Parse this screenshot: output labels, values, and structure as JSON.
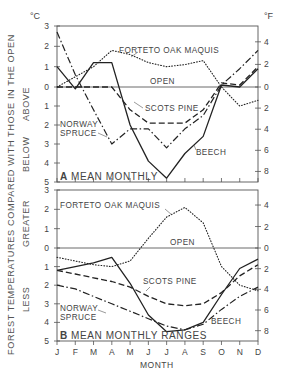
{
  "figure": {
    "y_axis_title": "FOREST TEMPERATURES COMPARED WITH THOSE IN THE OPEN",
    "x_axis_title": "MONTH",
    "unit_left": "°C",
    "unit_right": "°F",
    "panelA": {
      "label_letter": "A",
      "label_text": "MEAN MONTHLY",
      "side_top": "ABOVE",
      "side_bottom": "BELOW"
    },
    "panelB": {
      "label_letter": "B",
      "label_text": "MEAN MONTHLY RANGES",
      "side_top": "GREATER",
      "side_bottom": "LESS"
    },
    "series_labels": {
      "forteto": "FORTETO OAK MAQUIS",
      "open": "OPEN",
      "scots": "SCOTS PINE",
      "norway1": "NORWAY",
      "norway2": "SPRUCE",
      "beech": "BEECH"
    }
  },
  "chart_data": [
    {
      "type": "line",
      "title": "A MEAN MONTHLY",
      "xlabel": "MONTH",
      "ylabel": "FOREST TEMPERATURES COMPARED WITH THOSE IN THE OPEN (°C; ABOVE positive, BELOW negative)",
      "categories": [
        "J",
        "F",
        "M",
        "A",
        "M",
        "J",
        "J",
        "A",
        "S",
        "O",
        "N",
        "D"
      ],
      "ylim": [
        -5,
        3
      ],
      "yticks_left_c": [
        "3",
        "2",
        "1",
        "0",
        "1",
        "2",
        "3",
        "4",
        "5"
      ],
      "yticks_right_f": [
        "4",
        "2",
        "0",
        "2",
        "4",
        "6",
        "8"
      ],
      "grid": false,
      "series": [
        {
          "name": "OPEN",
          "style": "solid-thin",
          "values": [
            0,
            0,
            0,
            0,
            0,
            0,
            0,
            0,
            0,
            0,
            0,
            0
          ]
        },
        {
          "name": "FORTETO OAK MAQUIS",
          "style": "dotted",
          "values": [
            0.0,
            0.5,
            1.0,
            1.8,
            1.6,
            1.2,
            1.0,
            1.1,
            1.3,
            0.0,
            -1.0,
            -0.7
          ]
        },
        {
          "name": "BEECH",
          "style": "solid",
          "values": [
            1.0,
            -0.1,
            1.2,
            1.2,
            -2.0,
            -3.9,
            -4.8,
            -3.5,
            -2.6,
            0.1,
            0.0,
            0.9
          ]
        },
        {
          "name": "SCOTS PINE",
          "style": "dashed",
          "values": [
            0.0,
            0.0,
            0.0,
            0.0,
            -1.2,
            -1.9,
            -1.9,
            -1.9,
            -1.2,
            0.2,
            0.1,
            1.0
          ]
        },
        {
          "name": "NORWAY SPRUCE",
          "style": "dash-dot",
          "values": [
            2.7,
            0.6,
            -1.2,
            -3.0,
            -2.2,
            -2.2,
            -3.2,
            -2.2,
            -1.5,
            0.1,
            0.9,
            1.8
          ]
        }
      ]
    },
    {
      "type": "line",
      "title": "B MEAN MONTHLY RANGES",
      "xlabel": "MONTH",
      "ylabel": "FOREST TEMPERATURES COMPARED WITH THOSE IN THE OPEN (°C; GREATER positive, LESS negative)",
      "categories": [
        "J",
        "F",
        "M",
        "A",
        "M",
        "J",
        "J",
        "A",
        "S",
        "O",
        "N",
        "D"
      ],
      "ylim": [
        -5,
        3
      ],
      "yticks_left_c": [
        "3",
        "2",
        "1",
        "0",
        "1",
        "2",
        "3",
        "4",
        "5"
      ],
      "yticks_right_f": [
        "4",
        "2",
        "0",
        "2",
        "4",
        "6",
        "8"
      ],
      "grid": false,
      "series": [
        {
          "name": "OPEN",
          "style": "solid-thin",
          "values": [
            0,
            0,
            0,
            0,
            0,
            0,
            0,
            0,
            0,
            0,
            0,
            0
          ]
        },
        {
          "name": "FORTETO OAK MAQUIS",
          "style": "dotted",
          "values": [
            -0.5,
            -0.7,
            -0.9,
            -1.0,
            -0.7,
            0.5,
            1.6,
            2.1,
            1.3,
            -1.0,
            -2.0,
            -2.3
          ]
        },
        {
          "name": "BEECH",
          "style": "solid",
          "values": [
            -1.2,
            -1.0,
            -0.8,
            -0.5,
            -1.9,
            -3.6,
            -4.5,
            -4.4,
            -4.0,
            -2.5,
            -1.1,
            -0.6
          ]
        },
        {
          "name": "SCOTS PINE",
          "style": "dashed",
          "values": [
            -1.2,
            -1.4,
            -1.6,
            -1.8,
            -2.1,
            -2.6,
            -3.0,
            -3.1,
            -3.0,
            -2.4,
            -1.5,
            -0.9
          ]
        },
        {
          "name": "NORWAY SPRUCE",
          "style": "dash-dot",
          "values": [
            -2.0,
            -2.2,
            -2.6,
            -3.0,
            -3.4,
            -3.8,
            -4.2,
            -4.4,
            -4.1,
            -3.3,
            -2.6,
            -2.1
          ]
        }
      ]
    }
  ]
}
